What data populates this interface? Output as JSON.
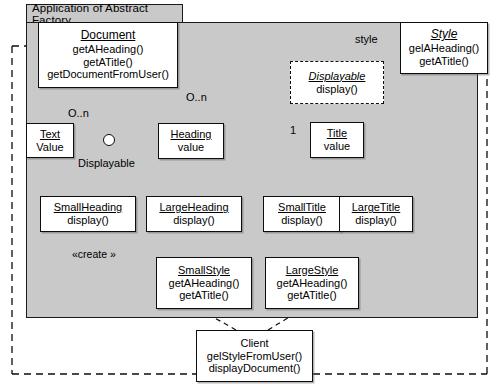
{
  "diagram": {
    "title": "Application of Abstract Factory",
    "package_label": "Application of Abstract Factory",
    "colors": {
      "package_fill": "#c9c9c9",
      "class_fill": "#ffffff",
      "line": "#0d0d0d",
      "page_background": "#ffffff"
    },
    "classes": [
      {
        "id": "document",
        "name": "Document",
        "stereotype": "",
        "italic_name": false,
        "dashed": false,
        "operations": [
          "getAHeading()",
          "getATitle()",
          "getDocumentFromUser()"
        ]
      },
      {
        "id": "style",
        "name": "Style",
        "stereotype": "",
        "italic_name": true,
        "dashed": false,
        "operations": [
          "gelAHeading()",
          "getATitle()"
        ]
      },
      {
        "id": "displayable",
        "name": "Displayable",
        "stereotype": "",
        "italic_name": true,
        "dashed": true,
        "operations": [
          "display()"
        ]
      },
      {
        "id": "text",
        "name": "Text",
        "stereotype": "",
        "italic_name": false,
        "dashed": false,
        "operations": [
          "Value"
        ]
      },
      {
        "id": "heading",
        "name": "Heading",
        "stereotype": "",
        "italic_name": false,
        "dashed": false,
        "operations": [
          "value"
        ]
      },
      {
        "id": "title",
        "name": "Title",
        "stereotype": "",
        "italic_name": false,
        "dashed": false,
        "operations": [
          "value"
        ]
      },
      {
        "id": "smallheading",
        "name": "SmallHeading",
        "stereotype": "",
        "italic_name": false,
        "dashed": false,
        "operations": [
          "display()"
        ]
      },
      {
        "id": "largeheading",
        "name": "LargeHeading",
        "stereotype": "",
        "italic_name": false,
        "dashed": false,
        "operations": [
          "display()"
        ]
      },
      {
        "id": "smalltitle",
        "name": "SmallTitle",
        "stereotype": "",
        "italic_name": false,
        "dashed": false,
        "operations": [
          "display()"
        ]
      },
      {
        "id": "largetitle",
        "name": "LargeTitle",
        "stereotype": "",
        "italic_name": false,
        "dashed": false,
        "operations": [
          "display()"
        ]
      },
      {
        "id": "smallstyle",
        "name": "SmallStyle",
        "stereotype": "",
        "italic_name": false,
        "dashed": false,
        "operations": [
          "getAHeading()",
          "getATitle()"
        ]
      },
      {
        "id": "largestyle",
        "name": "LargeStyle",
        "stereotype": "",
        "italic_name": false,
        "dashed": false,
        "operations": [
          "getAHeading()",
          "getATitle()"
        ]
      },
      {
        "id": "client",
        "name": "Client",
        "stereotype": "",
        "italic_name": false,
        "dashed": false,
        "operations": [
          "gelStyleFromUser()",
          "displayDocument()"
        ]
      }
    ],
    "edge_labels": {
      "style": "style",
      "mult_text": "O..n",
      "mult_heading": "O..n",
      "mult_title": "1",
      "displayable_iface": "Displayable",
      "create_stereotype": "«create »"
    }
  }
}
